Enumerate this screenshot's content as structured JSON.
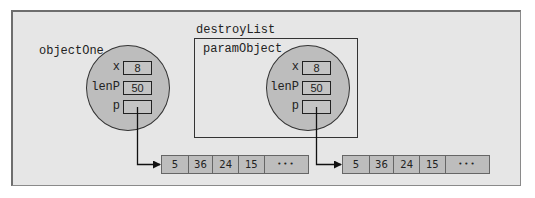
{
  "diagram": {
    "outer_object_label": "objectOne",
    "function_label": "destroyList",
    "param_label": "paramObject",
    "objects": [
      {
        "name": "objectOne",
        "fields": [
          {
            "name": "x",
            "value": "8"
          },
          {
            "name": "lenP",
            "value": "50"
          },
          {
            "name": "p",
            "value": ""
          }
        ]
      },
      {
        "name": "paramObject",
        "fields": [
          {
            "name": "x",
            "value": "8"
          },
          {
            "name": "lenP",
            "value": "50"
          },
          {
            "name": "p",
            "value": ""
          }
        ]
      }
    ],
    "arrays": [
      {
        "cells": [
          "5",
          "36",
          "24",
          "15",
          "•••"
        ]
      },
      {
        "cells": [
          "5",
          "36",
          "24",
          "15",
          "•••"
        ]
      }
    ],
    "colors": {
      "background": "#e6e6e6",
      "object_fill": "#bdbdbd",
      "line": "#222222"
    }
  }
}
